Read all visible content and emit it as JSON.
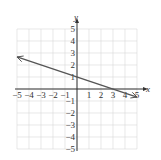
{
  "chart_data": {
    "type": "line",
    "title": "",
    "xlabel": "x",
    "ylabel": "y",
    "xlim": [
      -5,
      5
    ],
    "ylim": [
      -5,
      5
    ],
    "grid": true,
    "x_ticks": [
      "-5",
      "-4",
      "-3",
      "-2",
      "-1",
      "1",
      "2",
      "3",
      "4",
      "5"
    ],
    "y_ticks": [
      "5",
      "4",
      "3",
      "2",
      "1",
      "-1",
      "-2",
      "-3",
      "-4",
      "-5"
    ],
    "series": [
      {
        "name": "line",
        "equation": "y = -x/3 + 1",
        "x": [
          -5,
          0,
          3,
          5
        ],
        "y": [
          2.67,
          1,
          0,
          -0.67
        ],
        "arrows": "both"
      }
    ]
  },
  "axes": {
    "x_label": "x",
    "y_label": "y"
  },
  "colors": {
    "grid": "#d9d9d9",
    "axis": "#333333",
    "line": "#555555"
  }
}
